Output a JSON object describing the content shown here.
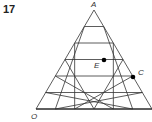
{
  "question": {
    "number": "17"
  },
  "diagram": {
    "type": "triangular-grid",
    "divisions": 6,
    "line_color": "#333333",
    "vertices": {
      "A": {
        "label": "A",
        "x": 94,
        "y": 10
      },
      "O": {
        "label": "O",
        "x": 36,
        "y": 109
      },
      "right": {
        "x": 152,
        "y": 109
      }
    },
    "points": [
      {
        "label": "E",
        "x": 104,
        "y": 60,
        "marked": true
      },
      {
        "label": "C",
        "x": 133,
        "y": 77,
        "marked": true
      }
    ],
    "labels": {
      "A": "A",
      "O": "O",
      "E": "E",
      "C": "C"
    }
  }
}
